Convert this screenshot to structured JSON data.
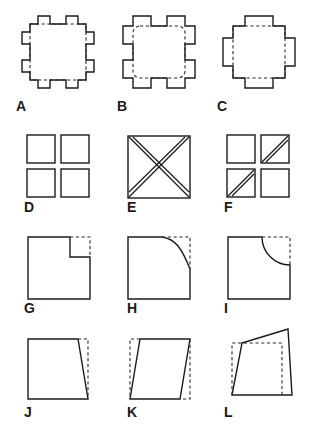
{
  "figure": {
    "title": "",
    "background_color": "#ffffff",
    "line_color": "#1b1b1b",
    "dashed_line_color": "#2a2a2a",
    "rows": 4,
    "columns": 3,
    "items": [
      {
        "label": "A",
        "description": "square with eight outward tabs, two per side, dashed inner square outline"
      },
      {
        "label": "B",
        "description": "square with four outward tabs at the corners, dashed rounded inner square outline"
      },
      {
        "label": "C",
        "description": "square with four outward tabs, one centered on each side, dashed inner square outline"
      },
      {
        "label": "D",
        "description": "four separate small squares arranged two by two"
      },
      {
        "label": "E",
        "description": "square with both diagonals drawn as double lines forming an X"
      },
      {
        "label": "F",
        "description": "four small squares two by two, top-right and bottom-left each crossed by a double diagonal line"
      },
      {
        "label": "G",
        "description": "square with a rectangular notch removed from the top-right corner, dashed lines show the removed part"
      },
      {
        "label": "H",
        "description": "square with the top-right corner removed by a curved diagonal cut, dashed lines show the removed part"
      },
      {
        "label": "I",
        "description": "square with a quarter-circle arc removed from the top-right corner, dashed lines show the removed part"
      },
      {
        "label": "J",
        "description": "square with the right edge slanted inward, dashed lines show the original square"
      },
      {
        "label": "K",
        "description": "square skewed into a parallelogram, dashed lines show the original square"
      },
      {
        "label": "L",
        "description": "square deformed into an irregular quadrilateral, dashed lines show the original square"
      }
    ]
  }
}
